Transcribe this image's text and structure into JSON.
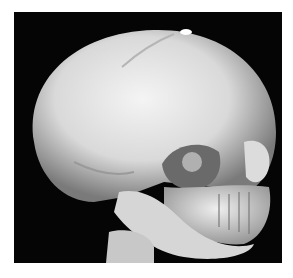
{
  "figure": {
    "background_color": "#050505",
    "bone_color": "#e6e6e6"
  }
}
